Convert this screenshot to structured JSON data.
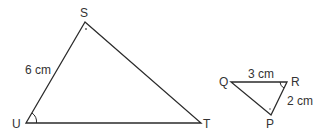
{
  "triangle_stu": {
    "vertices": {
      "S": "S",
      "T": "T",
      "U": "U"
    },
    "side_su_label": "6 cm"
  },
  "triangle_pqr": {
    "vertices": {
      "P": "P",
      "Q": "Q",
      "R": "R"
    },
    "side_qr_label": "3 cm",
    "side_rp_label": "2 cm"
  },
  "colors": {
    "line": "#2b2b2b",
    "text": "#333333"
  }
}
